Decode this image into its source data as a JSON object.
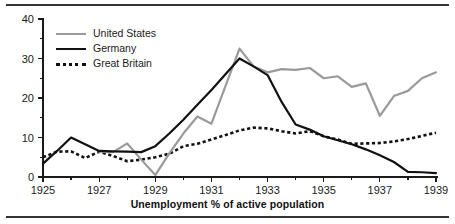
{
  "caption": "Unemployment % of active population",
  "legend": {
    "position": "top-left-inside",
    "items": [
      {
        "label": "United States",
        "style": "solid",
        "color": "#9a9a9a",
        "icon": "line-swatch-icon"
      },
      {
        "label": "Germany",
        "style": "solid",
        "color": "#111111",
        "icon": "line-swatch-icon"
      },
      {
        "label": "Great Britain",
        "style": "dotted",
        "color": "#111111",
        "icon": "dotted-line-swatch-icon"
      }
    ]
  },
  "axes": {
    "y_ticks_major": [
      "0",
      "10",
      "20",
      "30",
      "40"
    ],
    "y_minor_step": 5,
    "x_ticks_major": [
      "1925",
      "1927",
      "1929",
      "1931",
      "1933",
      "1935",
      "1937",
      "1939"
    ],
    "x_minor_step": 1
  },
  "chart_data": {
    "type": "line",
    "title": "",
    "subtitle": "",
    "xlabel": "Unemployment % of active population",
    "ylabel": "",
    "xlim": [
      1925,
      1939
    ],
    "ylim": [
      0,
      40
    ],
    "grid": false,
    "legend_position": "upper left",
    "x": [
      1925,
      1925.5,
      1926,
      1926.5,
      1927,
      1927.5,
      1928,
      1928.5,
      1929,
      1929.5,
      1930,
      1930.5,
      1931,
      1931.5,
      1932,
      1932.5,
      1933,
      1933.5,
      1934,
      1934.5,
      1935,
      1935.5,
      1936,
      1936.5,
      1937,
      1937.5,
      1938,
      1938.5,
      1939
    ],
    "series": [
      {
        "name": "United States",
        "color": "#9a9a9a",
        "style": "solid",
        "values": [
          null,
          null,
          null,
          null,
          6.4,
          6.3,
          8.5,
          4.4,
          0.5,
          6.0,
          11.0,
          15.3,
          13.5,
          23.0,
          32.5,
          28.0,
          26.5,
          27.3,
          27.1,
          27.6,
          25.0,
          25.5,
          22.8,
          23.7,
          15.5,
          20.5,
          21.8,
          25.0,
          26.5
        ]
      },
      {
        "name": "Germany",
        "color": "#111111",
        "style": "solid",
        "values": [
          3.4,
          6.6,
          10.0,
          8.3,
          6.6,
          6.5,
          6.4,
          6.3,
          7.8,
          11.0,
          14.5,
          18.3,
          22.0,
          26.0,
          30.0,
          28.0,
          25.8,
          19.0,
          13.3,
          12.0,
          10.3,
          9.3,
          8.3,
          7.0,
          5.5,
          3.8,
          1.3,
          1.2,
          1.0
        ]
      },
      {
        "name": "Great Britain",
        "color": "#111111",
        "style": "dotted",
        "values": [
          5.0,
          6.4,
          6.5,
          4.8,
          6.4,
          5.3,
          4.0,
          4.4,
          5.0,
          5.9,
          7.8,
          8.4,
          9.5,
          10.6,
          11.8,
          12.5,
          12.3,
          11.6,
          11.0,
          11.6,
          10.3,
          9.5,
          8.4,
          8.5,
          8.6,
          9.0,
          9.6,
          10.4,
          11.2
        ]
      }
    ]
  }
}
